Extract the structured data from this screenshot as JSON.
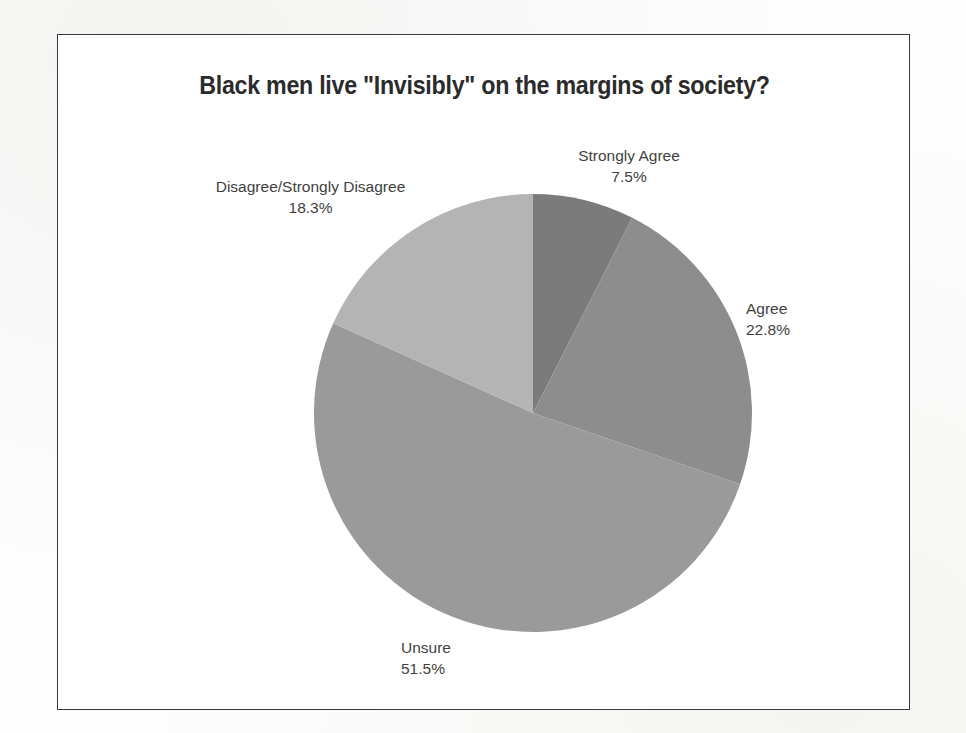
{
  "chart_data": {
    "type": "pie",
    "title": "Black men live \"Invisibly\" on the margins of society?",
    "xlabel": "",
    "ylabel": "",
    "legend_position": "none",
    "grid": false,
    "start_angle_deg": 90,
    "direction": "clockwise",
    "categories": [
      "Strongly Agree",
      "Agree",
      "Unsure",
      "Disagree/Strongly Disagree"
    ],
    "values": [
      7.5,
      22.8,
      51.5,
      18.3
    ],
    "value_unit": "%",
    "slices": [
      {
        "label": "Strongly Agree",
        "value": 7.5,
        "value_text": "7.5%",
        "color": "#7b7b7b"
      },
      {
        "label": "Agree",
        "value": 22.8,
        "value_text": "22.8%",
        "color": "#8d8d8d"
      },
      {
        "label": "Unsure",
        "value": 51.5,
        "value_text": "51.5%",
        "color": "#9a9a9a"
      },
      {
        "label": "Disagree/Strongly Disagree",
        "value": 18.3,
        "value_text": "18.3%",
        "color": "#b4b4b4"
      }
    ]
  },
  "frame": {
    "border_color": "#3a3a3a",
    "background": "#ffffff"
  },
  "text_color": "#3f3f3f",
  "title_color": "#2b2b2b"
}
